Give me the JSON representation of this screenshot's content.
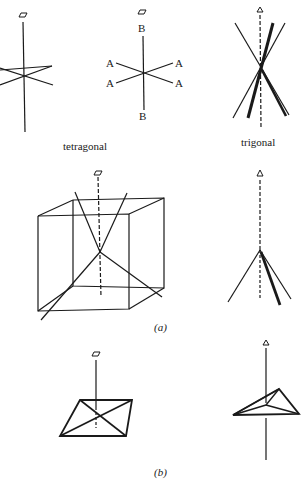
{
  "figure": {
    "labels": {
      "tetragonal": "tetragonal",
      "trigonal": "trigonal",
      "caption_a": "(a)",
      "caption_b": "(b)"
    },
    "axis_labels": {
      "A1": "A",
      "A2": "A",
      "A3": "A",
      "A4": "A",
      "B_top": "B",
      "B_bottom": "B"
    },
    "symbols": {
      "fourfold": "▱",
      "threefold": "△"
    },
    "colors": {
      "ink": "#1a1a1a",
      "background": "#ffffff"
    }
  }
}
